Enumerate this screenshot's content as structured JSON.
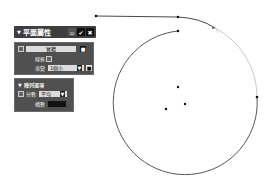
{
  "toolbar": {
    "title": "平面屬性",
    "collapse_icon": "▼",
    "buttons": [
      {
        "name": "minimize",
        "glyph": "▫"
      },
      {
        "name": "confirm",
        "glyph": "✔"
      },
      {
        "name": "close",
        "glyph": "✖"
      }
    ]
  },
  "panel1": {
    "solid_label": "實體",
    "solid_toggle_glyph": "■",
    "wireframe_label": "線框",
    "gradient_label": "漸變",
    "gradient_value": "1個小",
    "dropdown_arrow": "▼",
    "lock_glyph": "■"
  },
  "panel2": {
    "header": "陣列選項",
    "header_icon": "▼",
    "distribution_label": "分數",
    "distribution_value": "平均",
    "dropdown_arrow": "▼",
    "count_label": "構數",
    "count_value": ""
  },
  "canvas": {
    "stroke_color": "#333333",
    "circle": {
      "cx": 185,
      "cy": 106,
      "r": 72
    },
    "points": [
      [
        96,
        16
      ],
      [
        178,
        31
      ],
      [
        214,
        30
      ],
      [
        247,
        37
      ],
      [
        257,
        97
      ],
      [
        178,
        87
      ],
      [
        185,
        104
      ],
      [
        166,
        109
      ]
    ]
  }
}
